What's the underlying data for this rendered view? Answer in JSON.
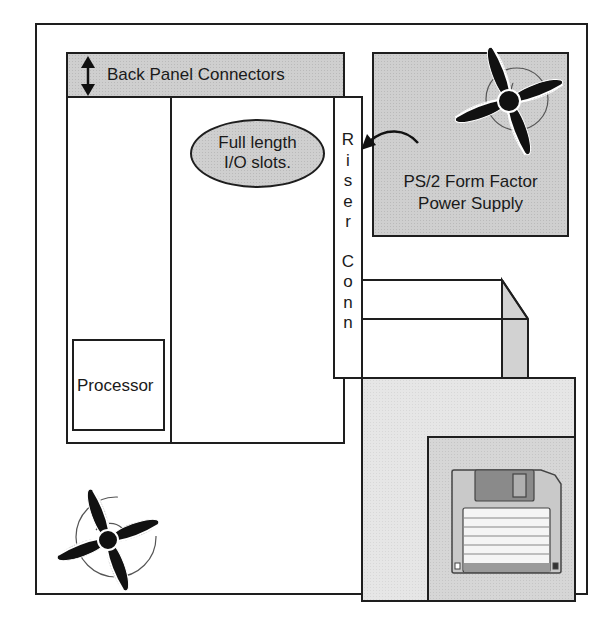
{
  "diagram": {
    "labels": {
      "back_panel": "Back Panel Connectors",
      "io_slots_line1": "Full length",
      "io_slots_line2": "I/O slots.",
      "riser_word1": [
        "R",
        "i",
        "s",
        "e",
        "r"
      ],
      "riser_word2": [
        "C",
        "o",
        "n",
        "n"
      ],
      "psu_line1": "PS/2 Form Factor",
      "psu_line2": "Power Supply",
      "processor": "Processor"
    },
    "components": [
      {
        "id": "chassis",
        "name": "Chassis outline"
      },
      {
        "id": "motherboard",
        "name": "Motherboard"
      },
      {
        "id": "back-panel",
        "name": "Back Panel Connectors"
      },
      {
        "id": "io-slots",
        "name": "Full length I/O slots."
      },
      {
        "id": "riser",
        "name": "Riser Conn"
      },
      {
        "id": "psu",
        "name": "PS/2 Form Factor Power Supply"
      },
      {
        "id": "processor",
        "name": "Processor"
      },
      {
        "id": "drive-bay",
        "name": "Drive bay"
      },
      {
        "id": "floppy",
        "name": "Floppy drive"
      },
      {
        "id": "psu-fan",
        "name": "Power supply fan"
      },
      {
        "id": "case-fan",
        "name": "Case fan"
      }
    ],
    "colors": {
      "stroke": "#1e1e1e",
      "gray_fill": "#cfcfcf",
      "light_fill": "#e6e6e6",
      "shutter": "#8a8a8a"
    }
  }
}
